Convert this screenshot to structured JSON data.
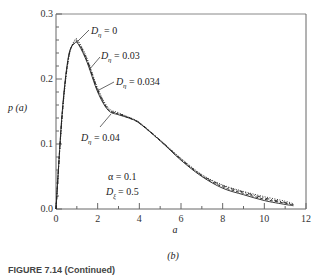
{
  "chart_data": {
    "type": "line",
    "title": "",
    "xlabel": "a",
    "ylabel": "p (a)",
    "xlim": [
      0,
      12
    ],
    "ylim": [
      0.0,
      0.3
    ],
    "x_ticks": [
      "0",
      "2",
      "4",
      "6",
      "8",
      "10",
      "12"
    ],
    "y_ticks": [
      "0.0",
      "0.1",
      "0.2",
      "0.3"
    ],
    "grid": false,
    "legend": "inline annotations with leader lines",
    "parameters": {
      "alpha": "α = 0.1",
      "D_xi": "D_ξ = 0.5"
    },
    "series": [
      {
        "name": "D_η = 0",
        "style": "solid",
        "x": [
          0.0,
          0.3,
          0.6,
          0.9,
          1.1,
          1.5,
          2.0,
          2.5,
          3.0,
          3.5,
          4.0,
          5.0,
          6.0,
          7.0,
          8.0,
          9.0,
          10.0,
          11.0,
          11.4
        ],
        "y": [
          0.0,
          0.15,
          0.235,
          0.255,
          0.252,
          0.225,
          0.18,
          0.152,
          0.145,
          0.14,
          0.132,
          0.105,
          0.075,
          0.05,
          0.032,
          0.022,
          0.013,
          0.007,
          0.005
        ]
      },
      {
        "name": "D_η = 0.03",
        "style": "dashed",
        "x": [
          0.0,
          0.3,
          0.6,
          0.9,
          1.1,
          1.5,
          2.0,
          2.5,
          3.0,
          3.5,
          4.0,
          5.0,
          6.0,
          7.0,
          8.0,
          9.0,
          10.0,
          11.0,
          11.4
        ],
        "y": [
          0.0,
          0.148,
          0.233,
          0.256,
          0.253,
          0.227,
          0.182,
          0.153,
          0.146,
          0.14,
          0.132,
          0.105,
          0.076,
          0.051,
          0.034,
          0.024,
          0.015,
          0.009,
          0.006
        ]
      },
      {
        "name": "D_η = 0.034",
        "style": "dash-dot",
        "x": [
          0.0,
          0.3,
          0.6,
          0.9,
          1.1,
          1.5,
          2.0,
          2.5,
          3.0,
          3.5,
          4.0,
          5.0,
          6.0,
          7.0,
          8.0,
          9.0,
          10.0,
          11.0,
          11.4
        ],
        "y": [
          0.0,
          0.146,
          0.232,
          0.258,
          0.255,
          0.229,
          0.184,
          0.154,
          0.147,
          0.141,
          0.133,
          0.106,
          0.077,
          0.052,
          0.036,
          0.026,
          0.017,
          0.01,
          0.007
        ]
      },
      {
        "name": "D_η = 0.04",
        "style": "dotted",
        "x": [
          0.0,
          0.3,
          0.6,
          0.9,
          1.1,
          1.5,
          2.0,
          2.5,
          3.0,
          3.5,
          4.0,
          5.0,
          6.0,
          7.0,
          8.0,
          9.0,
          10.0,
          11.0,
          11.4
        ],
        "y": [
          0.0,
          0.144,
          0.23,
          0.26,
          0.257,
          0.231,
          0.186,
          0.156,
          0.148,
          0.141,
          0.133,
          0.106,
          0.078,
          0.053,
          0.037,
          0.027,
          0.019,
          0.012,
          0.008
        ]
      }
    ]
  },
  "labels": {
    "ylabel": "p (a)",
    "xlabel": "a",
    "panel": "(b)",
    "ann_d0": "= 0",
    "ann_d003": "= 0.03",
    "ann_d0034": "= 0.034",
    "ann_d004": "= 0.04",
    "d_symbol": "D",
    "eta": "η",
    "xi": "ξ",
    "alpha_text": "α = 0.1",
    "dxi_value": "= 0.5",
    "caption": "FIGURE 7.14  (Continued)"
  }
}
